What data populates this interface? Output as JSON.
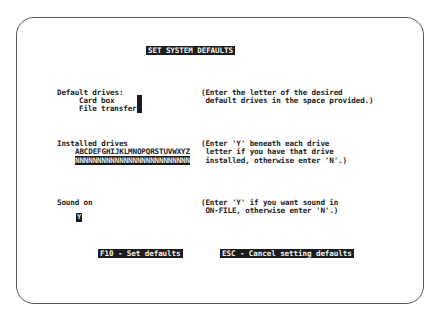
{
  "screen": {
    "title": "SET SYSTEM DEFAULTS"
  },
  "default_drives": {
    "heading": "Default drives:",
    "card_box_label": "Card box",
    "card_box_value": "",
    "file_transfer_label": "File transfer",
    "file_transfer_value": "",
    "help_line1": "(Enter the letter of the desired",
    "help_line2": " default drives in the space provided.)"
  },
  "installed_drives": {
    "heading": "Installed drives",
    "letters": "ABCDEFGHIJKLMNOPQRSTUVWXYZ",
    "values": "NNNNNNNNNNNNNNNNNNNNNNNNNN",
    "help_line1": "(Enter 'Y' beneath each drive",
    "help_line2": " letter if you have that drive",
    "help_line3": " installed, otherwise enter 'N'.)"
  },
  "sound": {
    "label": "Sound on",
    "value": "Y",
    "help_line1": "(Enter 'Y' if you want sound in",
    "help_line2": " ON-FILE, otherwise enter 'N'.)"
  },
  "function_keys": {
    "set_defaults": "F10 - Set defaults",
    "cancel": "ESC - Cancel setting defaults"
  },
  "colors": {
    "reverse_bg": "#1c1c1c",
    "reverse_fg": "#f2f2f2",
    "text": "#222222",
    "bezel": "#555555"
  }
}
